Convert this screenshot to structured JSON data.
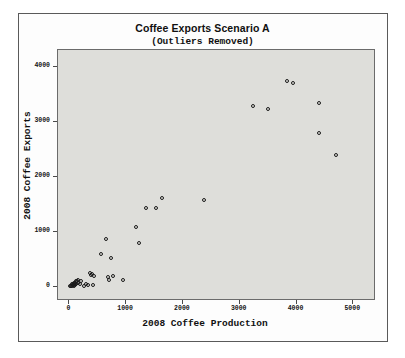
{
  "chart_data": {
    "type": "scatter",
    "title": "Coffee Exports Scenario A",
    "subtitle": "(Outliers Removed)",
    "xlabel": "2008 Coffee Production",
    "ylabel": "2008 Coffee Exports",
    "xlim": [
      -200,
      5400
    ],
    "ylim": [
      -260,
      4300
    ],
    "xticks": [
      0,
      1000,
      2000,
      3000,
      4000,
      5000
    ],
    "yticks": [
      0,
      1000,
      2000,
      3000,
      4000
    ],
    "xtick_labels": [
      "0",
      "1000",
      "2000",
      "3000",
      "4000",
      "5000"
    ],
    "ytick_labels": [
      "0",
      "1000",
      "2000",
      "3000",
      "4000"
    ],
    "grid": false,
    "legend": null,
    "plot_background": "#dededa",
    "marker": "open-circle",
    "marker_color": "#1a1a1a",
    "points": [
      {
        "x": 20,
        "y": 10
      },
      {
        "x": 35,
        "y": 20
      },
      {
        "x": 45,
        "y": 15
      },
      {
        "x": 50,
        "y": 40
      },
      {
        "x": 60,
        "y": 30
      },
      {
        "x": 70,
        "y": 55
      },
      {
        "x": 75,
        "y": 20
      },
      {
        "x": 85,
        "y": 45
      },
      {
        "x": 90,
        "y": 70
      },
      {
        "x": 95,
        "y": 25
      },
      {
        "x": 105,
        "y": 60
      },
      {
        "x": 115,
        "y": 95
      },
      {
        "x": 120,
        "y": 40
      },
      {
        "x": 130,
        "y": 110
      },
      {
        "x": 150,
        "y": 75
      },
      {
        "x": 160,
        "y": 130
      },
      {
        "x": 185,
        "y": 50
      },
      {
        "x": 210,
        "y": 100
      },
      {
        "x": 250,
        "y": 20
      },
      {
        "x": 300,
        "y": 40
      },
      {
        "x": 330,
        "y": 25
      },
      {
        "x": 360,
        "y": 250
      },
      {
        "x": 375,
        "y": 215
      },
      {
        "x": 395,
        "y": 230
      },
      {
        "x": 410,
        "y": 30
      },
      {
        "x": 430,
        "y": 200
      },
      {
        "x": 555,
        "y": 600
      },
      {
        "x": 650,
        "y": 860
      },
      {
        "x": 680,
        "y": 175
      },
      {
        "x": 700,
        "y": 120
      },
      {
        "x": 740,
        "y": 530
      },
      {
        "x": 760,
        "y": 190
      },
      {
        "x": 950,
        "y": 125
      },
      {
        "x": 1180,
        "y": 1090
      },
      {
        "x": 1230,
        "y": 800
      },
      {
        "x": 1350,
        "y": 1430
      },
      {
        "x": 1520,
        "y": 1425
      },
      {
        "x": 1640,
        "y": 1620
      },
      {
        "x": 2370,
        "y": 1570
      },
      {
        "x": 3240,
        "y": 3290
      },
      {
        "x": 3500,
        "y": 3230
      },
      {
        "x": 3830,
        "y": 3740
      },
      {
        "x": 3930,
        "y": 3700
      },
      {
        "x": 4390,
        "y": 3340
      },
      {
        "x": 4400,
        "y": 2800
      },
      {
        "x": 4690,
        "y": 2390
      }
    ]
  }
}
